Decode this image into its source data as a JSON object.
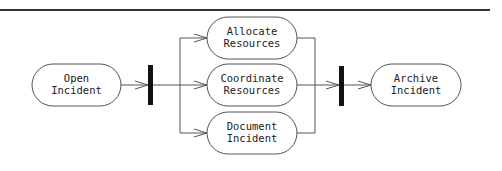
{
  "diagram": {
    "type": "activity",
    "nodes": [
      {
        "id": "open",
        "line1": "Open",
        "line2": "Incident"
      },
      {
        "id": "allocate",
        "line1": "Allocate",
        "line2": "Resources"
      },
      {
        "id": "coordinate",
        "line1": "Coordinate",
        "line2": "Resources"
      },
      {
        "id": "document",
        "line1": "Document",
        "line2": "Incident"
      },
      {
        "id": "archive",
        "line1": "Archive",
        "line2": "Incident"
      }
    ],
    "bars": [
      {
        "id": "fork",
        "kind": "fork"
      },
      {
        "id": "join",
        "kind": "join"
      }
    ],
    "edges": [
      {
        "from": "open",
        "to": "fork"
      },
      {
        "from": "fork",
        "to": "allocate"
      },
      {
        "from": "fork",
        "to": "coordinate"
      },
      {
        "from": "fork",
        "to": "document"
      },
      {
        "from": "allocate",
        "to": "join"
      },
      {
        "from": "coordinate",
        "to": "join"
      },
      {
        "from": "document",
        "to": "join"
      },
      {
        "from": "join",
        "to": "archive"
      }
    ],
    "colors": {
      "stroke": "#555555",
      "bar": "#111111",
      "rule": "#333333",
      "background": "#ffffff"
    }
  }
}
